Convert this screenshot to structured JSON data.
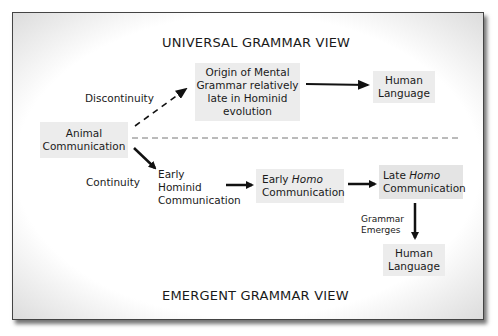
{
  "diagram": {
    "top_title": "UNIVERSAL GRAMMAR VIEW",
    "bottom_title": "EMERGENT GRAMMAR VIEW",
    "labels": {
      "discontinuity": "Discontinuity",
      "continuity": "Continuity",
      "grammar_emerges_1": "Grammar",
      "grammar_emerges_2": "Emerges"
    },
    "nodes": {
      "animal": {
        "line1": "Animal",
        "line2": "Communication"
      },
      "origin": {
        "line1": "Origin of Mental",
        "line2": "Grammar relatively",
        "line3": "late in Hominid",
        "line4": "evolution"
      },
      "human_top": {
        "line1": "Human",
        "line2": "Language"
      },
      "early_hominid": {
        "line1": "Early",
        "line2": "Hominid",
        "line3": "Communication"
      },
      "early_homo": {
        "pre": "Early ",
        "italic": "Homo",
        "line2": "Communication"
      },
      "late_homo": {
        "pre": "Late ",
        "italic": "Homo",
        "line2": "Communication"
      },
      "human_bottom": {
        "line1": "Human",
        "line2": "Language"
      }
    },
    "colors": {
      "box_fill": "#ececec",
      "arrow": "#111111",
      "divider": "#777777"
    }
  }
}
